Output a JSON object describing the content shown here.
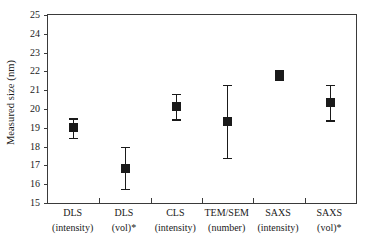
{
  "chart_data": {
    "type": "scatter",
    "title": "",
    "xlabel": "",
    "ylabel": "Measured size (nm)",
    "ylim": [
      15,
      25
    ],
    "yticks": [
      15,
      16,
      17,
      18,
      19,
      20,
      21,
      22,
      23,
      24,
      25
    ],
    "ytick_labels": [
      "15",
      "16",
      "17",
      "18",
      "19",
      "20",
      "21",
      "22",
      "23",
      "24",
      "25"
    ],
    "grid": false,
    "legend": "none",
    "marker": "filled-square",
    "error_bars": "vertical-capped",
    "categories": [
      "DLS (intensity)",
      "DLS (vol)*",
      "CLS (intensity)",
      "TEM/SEM (number)",
      "SAXS (intensity)",
      "SAXS (vol)*"
    ],
    "category_lines": [
      {
        "line1": "DLS",
        "line2": "(intensity)"
      },
      {
        "line1": "DLS",
        "line2": "(vol)*"
      },
      {
        "line1": "CLS",
        "line2": "(intensity)"
      },
      {
        "line1": "TEM/SEM",
        "line2": "(number)"
      },
      {
        "line1": "SAXS",
        "line2": "(intensity)"
      },
      {
        "line1": "SAXS",
        "line2": "(vol)*"
      }
    ],
    "values": [
      19.0,
      16.85,
      20.15,
      19.35,
      21.78,
      20.35
    ],
    "error_low": [
      18.45,
      15.75,
      19.45,
      17.4,
      21.55,
      19.4
    ],
    "error_high": [
      19.5,
      18.0,
      20.8,
      21.3,
      22.05,
      21.3
    ],
    "points": [
      {
        "category": "DLS (intensity)",
        "value": 19.0,
        "low": 18.45,
        "high": 19.5
      },
      {
        "category": "DLS (vol)*",
        "value": 16.85,
        "low": 15.75,
        "high": 18.0
      },
      {
        "category": "CLS (intensity)",
        "value": 20.15,
        "low": 19.45,
        "high": 20.8
      },
      {
        "category": "TEM/SEM (number)",
        "value": 19.35,
        "low": 17.4,
        "high": 21.3
      },
      {
        "category": "SAXS (intensity)",
        "value": 21.78,
        "low": 21.55,
        "high": 22.05
      },
      {
        "category": "SAXS (vol)*",
        "value": 20.35,
        "low": 19.4,
        "high": 21.3
      }
    ],
    "colors": {
      "marker": "#1a1a1a",
      "axis": "#3a3a3a",
      "background": "#ffffff",
      "text": "#1a1a1a"
    }
  }
}
